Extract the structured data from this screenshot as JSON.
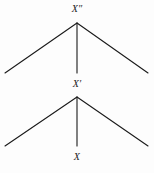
{
  "figure": {
    "type": "derivation-tree-diagram",
    "background_color": "#fdfdfd",
    "stroke_color": "#1a1a1a",
    "label_color": "#1a1a1a",
    "nodes": [
      {
        "id": "top",
        "label": "X″",
        "x": 77,
        "y": 23
      },
      {
        "id": "middle",
        "label": "X′",
        "x": 77,
        "y": 97
      },
      {
        "id": "bottom",
        "label": "X",
        "x": 77,
        "y": 148
      }
    ],
    "upper_tree": {
      "apex_x": 77,
      "apex_y": 23,
      "left_end_x": 5,
      "left_end_y": 73,
      "right_end_x": 148,
      "right_end_y": 73,
      "stem_end_x": 77,
      "stem_end_y": 73
    },
    "lower_tree": {
      "apex_x": 77,
      "apex_y": 97,
      "left_end_x": 5,
      "left_end_y": 146,
      "right_end_x": 148,
      "right_end_y": 146,
      "stem_end_x": 77,
      "stem_end_y": 146
    }
  }
}
